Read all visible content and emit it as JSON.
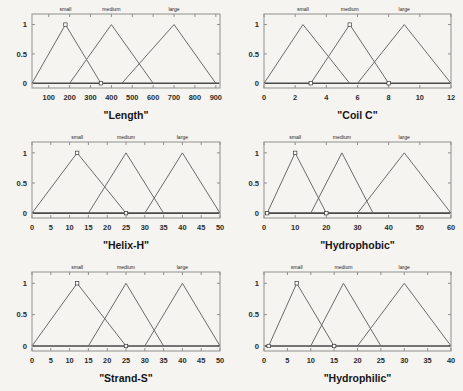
{
  "figure": {
    "background_color": "#f5f4f1",
    "line_color": "#6b6b6b",
    "axis_color": "#8f8f8d",
    "rows": 3,
    "columns": 2
  },
  "chart_data": [
    {
      "type": "line",
      "title": "\"Length\"",
      "xlabel": "",
      "ylabel": "",
      "xlim": [
        20,
        920
      ],
      "ylim": [
        -0.08,
        1.18
      ],
      "xticks": [
        100,
        200,
        300,
        400,
        500,
        600,
        700,
        800,
        900
      ],
      "yticks": [
        0,
        0.5,
        1
      ],
      "ytick_labels": [
        "0",
        "0.5",
        "1"
      ],
      "grid": false,
      "legend": "inline-above-peaks",
      "series": [
        {
          "name": "small",
          "x": [
            20,
            180,
            350
          ],
          "y": [
            0,
            1,
            0
          ]
        },
        {
          "name": "medium",
          "x": [
            200,
            400,
            600
          ],
          "y": [
            0,
            1,
            0
          ]
        },
        {
          "name": "large",
          "x": [
            450,
            700,
            900
          ],
          "y": [
            0,
            1,
            0
          ]
        }
      ],
      "markers": [
        {
          "x": 180,
          "y": 1
        },
        {
          "x": 350,
          "y": 0
        }
      ]
    },
    {
      "type": "line",
      "title": "\"Coil C\"",
      "xlabel": "",
      "ylabel": "",
      "xlim": [
        0,
        12
      ],
      "ylim": [
        -0.08,
        1.18
      ],
      "xticks": [
        0,
        2,
        4,
        6,
        8,
        10,
        12
      ],
      "yticks": [
        0,
        0.5,
        1
      ],
      "ytick_labels": [
        "0",
        "0.5",
        "1"
      ],
      "grid": false,
      "legend": "inline-above-peaks",
      "series": [
        {
          "name": "small",
          "x": [
            0,
            2.5,
            5.5
          ],
          "y": [
            0,
            1,
            0
          ]
        },
        {
          "name": "medium",
          "x": [
            3,
            5.5,
            8
          ],
          "y": [
            0,
            1,
            0
          ]
        },
        {
          "name": "large",
          "x": [
            6,
            9,
            12
          ],
          "y": [
            0,
            1,
            0
          ]
        }
      ],
      "markers": [
        {
          "x": 3,
          "y": 0
        },
        {
          "x": 5.5,
          "y": 1
        },
        {
          "x": 8,
          "y": 0
        }
      ]
    },
    {
      "type": "line",
      "title": "\"Helix-H\"",
      "xlabel": "",
      "ylabel": "",
      "xlim": [
        0,
        50
      ],
      "ylim": [
        -0.08,
        1.18
      ],
      "xticks": [
        0,
        5,
        10,
        15,
        20,
        25,
        30,
        35,
        40,
        45,
        50
      ],
      "yticks": [
        0,
        0.5,
        1
      ],
      "ytick_labels": [
        "0",
        "0.5",
        "1"
      ],
      "grid": false,
      "legend": "inline-above-peaks",
      "series": [
        {
          "name": "small",
          "x": [
            0,
            12,
            25
          ],
          "y": [
            0,
            1,
            0
          ]
        },
        {
          "name": "medium",
          "x": [
            15,
            25,
            35
          ],
          "y": [
            0,
            1,
            0
          ]
        },
        {
          "name": "large",
          "x": [
            30,
            40,
            50
          ],
          "y": [
            0,
            1,
            0
          ]
        }
      ],
      "markers": [
        {
          "x": 12,
          "y": 1
        },
        {
          "x": 25,
          "y": 0
        }
      ]
    },
    {
      "type": "line",
      "title": "\"Hydrophobic\"",
      "xlabel": "",
      "ylabel": "",
      "xlim": [
        0,
        60
      ],
      "ylim": [
        -0.08,
        1.18
      ],
      "xticks": [
        0,
        10,
        20,
        30,
        40,
        50,
        60
      ],
      "yticks": [
        0,
        0.5,
        1
      ],
      "ytick_labels": [
        "0",
        "0.5",
        "1"
      ],
      "grid": false,
      "legend": "inline-above-peaks",
      "series": [
        {
          "name": "small",
          "x": [
            1,
            10,
            20
          ],
          "y": [
            0,
            1,
            0
          ]
        },
        {
          "name": "medium",
          "x": [
            15,
            25,
            35
          ],
          "y": [
            0,
            1,
            0
          ]
        },
        {
          "name": "large",
          "x": [
            30,
            45,
            60
          ],
          "y": [
            0,
            1,
            0
          ]
        }
      ],
      "markers": [
        {
          "x": 1,
          "y": 0
        },
        {
          "x": 10,
          "y": 1
        },
        {
          "x": 20,
          "y": 0
        }
      ]
    },
    {
      "type": "line",
      "title": "\"Strand-S\"",
      "xlabel": "",
      "ylabel": "",
      "xlim": [
        0,
        50
      ],
      "ylim": [
        -0.08,
        1.18
      ],
      "xticks": [
        0,
        5,
        10,
        15,
        20,
        25,
        30,
        35,
        40,
        45,
        50
      ],
      "yticks": [
        0,
        0.5,
        1
      ],
      "ytick_labels": [
        "0",
        "0.5",
        "1"
      ],
      "grid": false,
      "legend": "inline-above-peaks",
      "series": [
        {
          "name": "small",
          "x": [
            0,
            12,
            25
          ],
          "y": [
            0,
            1,
            0
          ]
        },
        {
          "name": "medium",
          "x": [
            15,
            25,
            35
          ],
          "y": [
            0,
            1,
            0
          ]
        },
        {
          "name": "large",
          "x": [
            30,
            40,
            50
          ],
          "y": [
            0,
            1,
            0
          ]
        }
      ],
      "markers": [
        {
          "x": 12,
          "y": 1
        },
        {
          "x": 25,
          "y": 0
        }
      ]
    },
    {
      "type": "line",
      "title": "\"Hydrophilic\"",
      "xlabel": "",
      "ylabel": "",
      "xlim": [
        0,
        40
      ],
      "ylim": [
        -0.08,
        1.18
      ],
      "xticks": [
        0,
        5,
        10,
        15,
        20,
        25,
        30,
        35,
        40
      ],
      "yticks": [
        0,
        0.5,
        1
      ],
      "ytick_labels": [
        "0",
        "0.5",
        "1"
      ],
      "grid": false,
      "legend": "inline-above-peaks",
      "series": [
        {
          "name": "small",
          "x": [
            1,
            7,
            15
          ],
          "y": [
            0,
            1,
            0
          ]
        },
        {
          "name": "medium",
          "x": [
            10,
            17,
            25
          ],
          "y": [
            0,
            1,
            0
          ]
        },
        {
          "name": "large",
          "x": [
            20,
            30,
            40
          ],
          "y": [
            0,
            1,
            0
          ]
        }
      ],
      "markers": [
        {
          "x": 1,
          "y": 0
        },
        {
          "x": 7,
          "y": 1
        },
        {
          "x": 15,
          "y": 0
        }
      ]
    }
  ]
}
